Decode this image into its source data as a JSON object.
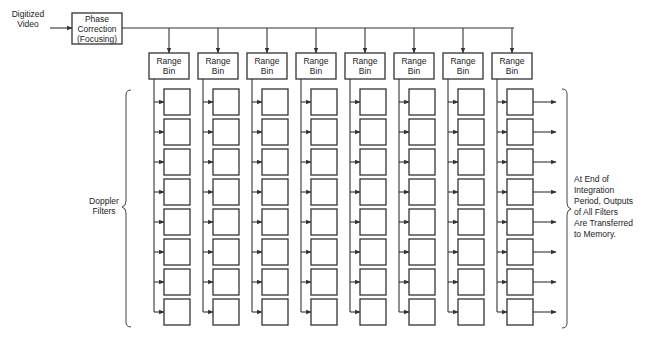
{
  "diagram": {
    "type": "signal-flow block diagram",
    "input_label": "Digitized\nVideo",
    "phase_correction": {
      "label": "Phase\nCorrection\n(Focusing)"
    },
    "range_bins": {
      "count": 8,
      "label": "Range\nBin"
    },
    "doppler_filters": {
      "per_range_bin": 8,
      "group_label": "Doppler\nFilters"
    },
    "output_note": "At End of\nIntegration\nPeriod, Outputs\nof All Filters\nAre Transferred\nto Memory."
  }
}
